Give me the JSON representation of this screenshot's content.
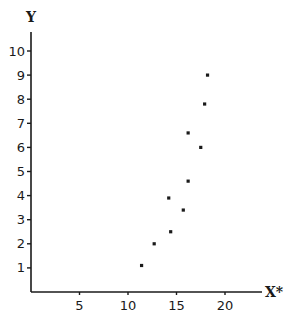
{
  "chart_data": {
    "type": "scatter",
    "title": "",
    "xlabel": "X*",
    "ylabel": "Y",
    "xlim": [
      0,
      24
    ],
    "ylim": [
      0,
      10.8
    ],
    "x_ticks": [
      5,
      10,
      15,
      20
    ],
    "y_ticks": [
      1,
      2,
      3,
      4,
      5,
      6,
      7,
      8,
      9,
      10
    ],
    "grid": false,
    "legend": null,
    "points": [
      {
        "x": 11.4,
        "y": 1.1
      },
      {
        "x": 12.7,
        "y": 2.0
      },
      {
        "x": 14.4,
        "y": 2.5
      },
      {
        "x": 14.2,
        "y": 3.9
      },
      {
        "x": 15.7,
        "y": 3.4
      },
      {
        "x": 16.2,
        "y": 4.6
      },
      {
        "x": 17.5,
        "y": 6.0
      },
      {
        "x": 16.2,
        "y": 6.6
      },
      {
        "x": 17.9,
        "y": 7.8
      },
      {
        "x": 18.2,
        "y": 9.0
      }
    ]
  },
  "colors": {
    "axis": "#1a1a1a",
    "marker": "#1a1a1a",
    "background": "#ffffff"
  }
}
